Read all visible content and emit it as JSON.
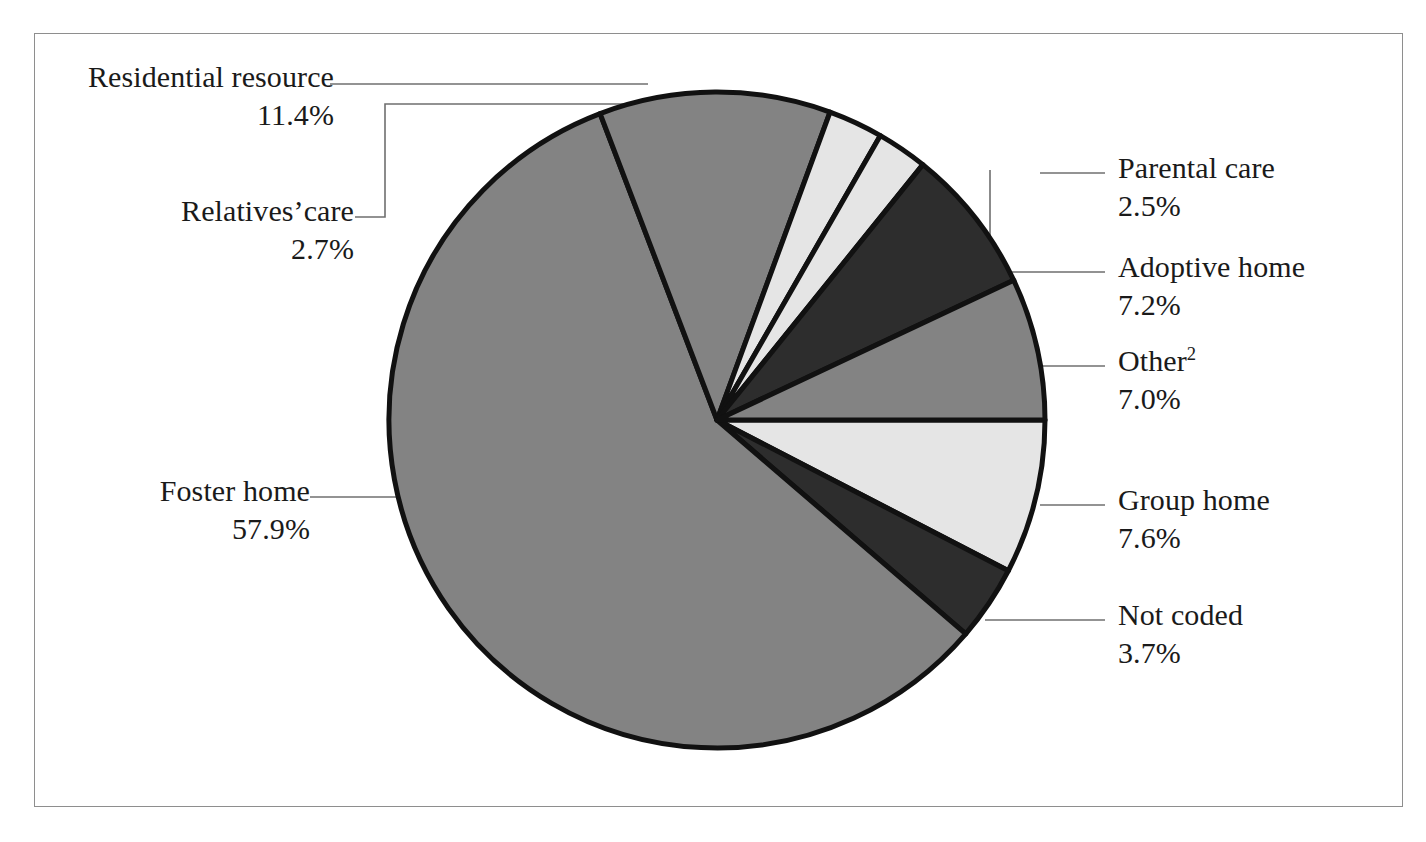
{
  "figure": {
    "background": "#ffffff",
    "frame_color": "#8e8e8e",
    "leader_color": "#6f6f6f",
    "outline_color": "#111111"
  },
  "chart_data": {
    "type": "pie",
    "title": "",
    "subtitle": "",
    "xlabel": "",
    "ylabel": "",
    "units": "percent",
    "legend_position": "callout-labels",
    "grid": false,
    "total": 100.0,
    "categories": [
      "Group home",
      "Not coded",
      "Foster home",
      "Residential resource",
      "Relatives’care",
      "Parental care",
      "Adoptive home",
      "Other"
    ],
    "values": [
      7.6,
      3.7,
      57.9,
      11.4,
      2.7,
      2.5,
      7.2,
      7.0
    ],
    "slices": [
      {
        "label": "Group home",
        "value": 7.6,
        "pct_text": "7.6%",
        "fill": "#e5e5e5",
        "start_deg": 0,
        "sweep_deg": 27.36,
        "side": "right"
      },
      {
        "label": "Not coded",
        "value": 3.7,
        "pct_text": "3.7%",
        "fill": "#2d2d2d",
        "start_deg": 27.36,
        "sweep_deg": 13.32,
        "side": "right"
      },
      {
        "label": "Foster home",
        "value": 57.9,
        "pct_text": "57.9%",
        "fill": "#838383",
        "start_deg": 40.68,
        "sweep_deg": 208.44,
        "side": "left"
      },
      {
        "label": "Residential resource",
        "value": 11.4,
        "pct_text": "11.4%",
        "fill": "#838383",
        "start_deg": 249.12,
        "sweep_deg": 41.04,
        "side": "left"
      },
      {
        "label": "Relatives’care",
        "value": 2.7,
        "pct_text": "2.7%",
        "fill": "#e5e5e5",
        "start_deg": 290.16,
        "sweep_deg": 9.72,
        "side": "left"
      },
      {
        "label": "Parental care",
        "value": 2.5,
        "pct_text": "2.5%",
        "fill": "#e5e5e5",
        "start_deg": 299.88,
        "sweep_deg": 9.0,
        "side": "right"
      },
      {
        "label": "Adoptive home",
        "value": 7.2,
        "pct_text": "7.2%",
        "fill": "#2d2d2d",
        "start_deg": 308.88,
        "sweep_deg": 25.92,
        "side": "right"
      },
      {
        "label": "Other",
        "value": 7.0,
        "pct_text": "7.0%",
        "fill": "#838383",
        "start_deg": 334.8,
        "sweep_deg": 25.2,
        "side": "right"
      }
    ]
  },
  "labels": {
    "residential_resource": {
      "name": "Residential resource",
      "pct": "11.4%"
    },
    "relatives_care": {
      "name": "Relatives’care",
      "pct": "2.7%"
    },
    "foster_home": {
      "name": "Foster home",
      "pct": "57.9%"
    },
    "parental_care": {
      "name": "Parental care",
      "pct": "2.5%"
    },
    "adoptive_home": {
      "name": "Adoptive home",
      "pct": "7.2%"
    },
    "other": {
      "name": "Other",
      "footnote": "2",
      "pct": "7.0%"
    },
    "group_home": {
      "name": "Group home",
      "pct": "7.6%"
    },
    "not_coded": {
      "name": "Not coded",
      "pct": "3.7%"
    }
  }
}
